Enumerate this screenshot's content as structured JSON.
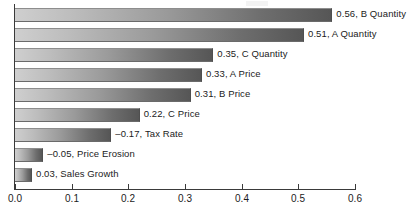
{
  "chart_data": {
    "type": "bar",
    "orientation": "horizontal",
    "title": "",
    "subtitle": "",
    "xlabel": "",
    "ylabel": "",
    "xlim": [
      0.0,
      0.6
    ],
    "grid": false,
    "legend": false,
    "legend_position": "none",
    "tick_labels": [
      "0.0",
      "0.1",
      "0.2",
      "0.3",
      "0.4",
      "0.5",
      "0.6"
    ],
    "tick_values": [
      0.0,
      0.1,
      0.2,
      0.3,
      0.4,
      0.5,
      0.6
    ],
    "categories": [
      "B Quantity",
      "A Quantity",
      "C Quantity",
      "A Price",
      "B Price",
      "C Price",
      "Tax Rate",
      "Price Erosion",
      "Sales Growth"
    ],
    "values": [
      0.56,
      0.51,
      0.35,
      0.33,
      0.31,
      0.22,
      -0.17,
      -0.05,
      0.03
    ],
    "magnitudes": [
      0.56,
      0.51,
      0.35,
      0.33,
      0.31,
      0.22,
      0.17,
      0.05,
      0.03
    ],
    "bars": [
      {
        "label": "0.56, B Quantity",
        "value": 0.56,
        "magnitude": 0.56,
        "category": "B Quantity"
      },
      {
        "label": "0.51, A Quantity",
        "value": 0.51,
        "magnitude": 0.51,
        "category": "A Quantity"
      },
      {
        "label": "0.35, C Quantity",
        "value": 0.35,
        "magnitude": 0.35,
        "category": "C Quantity"
      },
      {
        "label": "0.33, A Price",
        "value": 0.33,
        "magnitude": 0.33,
        "category": "A Price"
      },
      {
        "label": "0.31, B Price",
        "value": 0.31,
        "magnitude": 0.31,
        "category": "B Price"
      },
      {
        "label": "0.22, C Price",
        "value": 0.22,
        "magnitude": 0.22,
        "category": "C Price"
      },
      {
        "label": "–0.17, Tax Rate",
        "value": -0.17,
        "magnitude": 0.17,
        "category": "Tax Rate"
      },
      {
        "label": "–0.05, Price Erosion",
        "value": -0.05,
        "magnitude": 0.05,
        "category": "Price Erosion"
      },
      {
        "label": "0.03, Sales Growth",
        "value": 0.03,
        "magnitude": 0.03,
        "category": "Sales Growth"
      }
    ],
    "colors": {
      "bar_gradient_start": "#cfcfcf",
      "bar_gradient_end": "#565656",
      "axis": "#3a3a3a",
      "text": "#1b1b1b",
      "background": "#ffffff"
    }
  }
}
